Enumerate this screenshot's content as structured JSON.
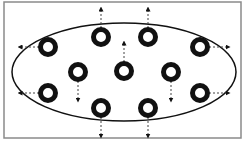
{
  "diagram": {
    "type": "particle-expansion",
    "colors": {
      "frame": "#8a8a8a",
      "ellipse": "#111111",
      "particle": "#111111",
      "arrow": "#444444",
      "background": "#ffffff"
    },
    "frame": {
      "x": 4,
      "y": 2,
      "width": 237,
      "height": 136
    },
    "ellipse": {
      "cx": 124,
      "cy": 72,
      "rx": 112,
      "ry": 49
    },
    "particles": [
      {
        "id": "p1",
        "cx": 48,
        "cy": 47,
        "arrow": "left"
      },
      {
        "id": "p2",
        "cx": 101,
        "cy": 37,
        "arrow": "up"
      },
      {
        "id": "p3",
        "cx": 148,
        "cy": 37,
        "arrow": "up"
      },
      {
        "id": "p4",
        "cx": 200,
        "cy": 47,
        "arrow": "right"
      },
      {
        "id": "p5",
        "cx": 78,
        "cy": 72,
        "arrow": "down"
      },
      {
        "id": "p6",
        "cx": 124,
        "cy": 71,
        "arrow": "up"
      },
      {
        "id": "p7",
        "cx": 171,
        "cy": 72,
        "arrow": "down"
      },
      {
        "id": "p8",
        "cx": 48,
        "cy": 93,
        "arrow": "left"
      },
      {
        "id": "p9",
        "cx": 101,
        "cy": 108,
        "arrow": "down"
      },
      {
        "id": "p10",
        "cx": 148,
        "cy": 108,
        "arrow": "down"
      },
      {
        "id": "p11",
        "cx": 200,
        "cy": 93,
        "arrow": "right"
      }
    ]
  }
}
